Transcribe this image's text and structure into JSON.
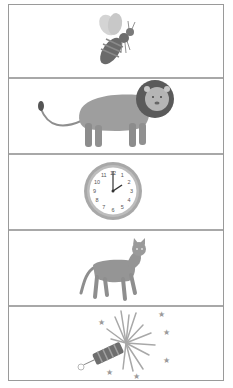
{
  "worksheet": {
    "panels": [
      {
        "id": "bee",
        "label": "bee",
        "icon": "bee-icon"
      },
      {
        "id": "lion",
        "label": "lion",
        "icon": "lion-icon"
      },
      {
        "id": "clock",
        "label": "clock",
        "icon": "clock-icon",
        "time": "2:00",
        "numbers": [
          "12",
          "1",
          "2",
          "3",
          "4",
          "5",
          "6",
          "7",
          "8",
          "9",
          "10",
          "11"
        ]
      },
      {
        "id": "cat",
        "label": "cat",
        "icon": "cat-icon"
      },
      {
        "id": "firework",
        "label": "firework",
        "icon": "firework-icon"
      }
    ]
  },
  "colors": {
    "border": "#9a9a9a",
    "divider": "#a8a8a8",
    "ink_dark": "#5e5e5e",
    "ink_mid": "#8a8a8a",
    "ink_light": "#c4c4c4"
  }
}
